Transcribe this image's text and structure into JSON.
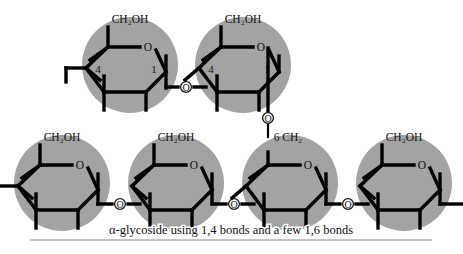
{
  "figure": {
    "caption": "α-glycoside using 1,4 bonds and a few 1,6 bonds",
    "colors": {
      "ring_fill": "#a3a3a3",
      "bond": "#000000",
      "background": "#ffffff",
      "oxygen_fill": "#ffffff",
      "rule": "#8a8a92",
      "text": "#111111"
    }
  },
  "labels": {
    "ch2oh": "CH₂OH",
    "ch2": "CH₂",
    "oxygen": "O",
    "c1": "1",
    "c4": "4",
    "c6": "6",
    "c6_ch2": "6 CH₂"
  },
  "rings": {
    "top_row": [
      {
        "id": "top-ring-1",
        "cx": 130,
        "cy": 65,
        "r": 48,
        "top_label": "CH₂OH",
        "c4": "4",
        "c1": "1",
        "ring_o": "O",
        "has_left_stub": true
      },
      {
        "id": "top-ring-2",
        "cx": 243,
        "cy": 65,
        "r": 48,
        "top_label": "CH₂OH",
        "c4": "4",
        "c1": "1",
        "ring_o": "O",
        "has_branch_down": true
      }
    ],
    "bottom_row": [
      {
        "id": "bottom-ring-1",
        "cx": 62,
        "cy": 183,
        "r": 48,
        "top_label": "CH₂OH",
        "ring_o": "O",
        "has_left_stub": true
      },
      {
        "id": "bottom-ring-2",
        "cx": 176,
        "cy": 183,
        "r": 48,
        "top_label": "CH₂OH",
        "ring_o": "O"
      },
      {
        "id": "bottom-ring-3",
        "cx": 290,
        "cy": 183,
        "r": 48,
        "top_label": "6 CH₂",
        "ring_o": "O",
        "is_branch_point": true
      },
      {
        "id": "bottom-ring-4",
        "cx": 404,
        "cy": 183,
        "r": 48,
        "top_label": "CH₂OH",
        "ring_o": "O",
        "has_right_stub": true
      }
    ]
  },
  "glycosidic_oxygens": [
    {
      "id": "o-top-1-2",
      "x": 186,
      "y": 87,
      "label": "O",
      "linkage": "1,4"
    },
    {
      "id": "o-branch-1-6",
      "x": 268,
      "y": 118,
      "label": "O",
      "linkage": "1,6"
    },
    {
      "id": "o-bottom-1-2",
      "x": 120,
      "y": 200,
      "label": "O",
      "linkage": "1,4"
    },
    {
      "id": "o-bottom-2-3",
      "x": 234,
      "y": 200,
      "label": "O",
      "linkage": "1,4"
    },
    {
      "id": "o-bottom-3-4",
      "x": 348,
      "y": 200,
      "label": "O",
      "linkage": "1,4"
    }
  ],
  "rule": {
    "x1": 30,
    "x2": 432,
    "y": 240
  }
}
